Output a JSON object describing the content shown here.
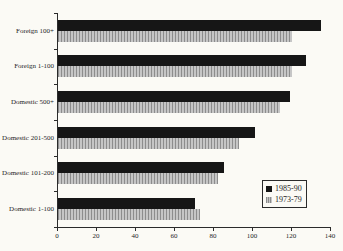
{
  "chart_data": {
    "type": "bar",
    "orientation": "horizontal",
    "title": "",
    "xlabel": "",
    "ylabel": "",
    "categories": [
      "Foreign 100+",
      "Foreign 1-100",
      "Domestic 500+",
      "Domestic 201-500",
      "Domestic 101-200",
      "Domestic 1-100"
    ],
    "series": [
      {
        "name": "1985-90",
        "style": "solid-black",
        "values": [
          135,
          127,
          119,
          101,
          85,
          70
        ]
      },
      {
        "name": "1973-79",
        "style": "hatched-vertical-gray",
        "values": [
          120,
          120,
          114,
          93,
          82,
          73
        ]
      }
    ],
    "xlim": [
      0,
      140
    ],
    "x_ticks": [
      0,
      20,
      40,
      60,
      80,
      100,
      120,
      140
    ],
    "grid": false,
    "legend_position": "lower-right"
  },
  "colors": {
    "background": "#fbfaf5",
    "bar_dark": "#161616",
    "bar_light": "#c6c6c6",
    "hatch": "#8d8d8d",
    "axis": "#2b2b2b",
    "text": "#1f1f1f"
  }
}
